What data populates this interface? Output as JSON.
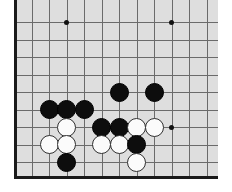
{
  "figure": {
    "kind": "go-board-diagram",
    "width": 232,
    "height": 192
  },
  "board": {
    "background_color": "#dedede",
    "line_color": "#6b6b6b",
    "edge_color": "#1a1a1a",
    "origin_x": 15,
    "origin_y": 22,
    "spacing": 17.5,
    "columns": 12,
    "rows": 9,
    "vertical_lines": [
      15,
      32.5,
      50,
      67.5,
      85,
      102.5,
      120,
      137.5,
      155,
      172.5,
      190,
      207.5
    ],
    "horizontal_lines": [
      22,
      39.5,
      57,
      74.5,
      92,
      109.5,
      127,
      144.5,
      162
    ],
    "edges_visible": [
      "left",
      "bottom"
    ]
  },
  "star_points": [
    {
      "name": "star-top-left",
      "x": 67.5,
      "y": 22
    },
    {
      "name": "star-top-right",
      "x": 172.5,
      "y": 22
    },
    {
      "name": "star-right",
      "x": 172.5,
      "y": 127
    }
  ],
  "stones": [
    {
      "color": "black",
      "x": 120,
      "y": 92
    },
    {
      "color": "black",
      "x": 155,
      "y": 92
    },
    {
      "color": "black",
      "x": 50,
      "y": 109.5
    },
    {
      "color": "black",
      "x": 67.5,
      "y": 109.5
    },
    {
      "color": "black",
      "x": 85,
      "y": 109.5
    },
    {
      "color": "white",
      "x": 67.5,
      "y": 127
    },
    {
      "color": "black",
      "x": 102.5,
      "y": 127
    },
    {
      "color": "black",
      "x": 120,
      "y": 127
    },
    {
      "color": "white",
      "x": 137.5,
      "y": 127
    },
    {
      "color": "white",
      "x": 155,
      "y": 127
    },
    {
      "color": "white",
      "x": 50,
      "y": 144.5
    },
    {
      "color": "white",
      "x": 67.5,
      "y": 144.5
    },
    {
      "color": "white",
      "x": 102.5,
      "y": 144.5
    },
    {
      "color": "white",
      "x": 120,
      "y": 144.5
    },
    {
      "color": "black",
      "x": 137.5,
      "y": 144.5
    },
    {
      "color": "black",
      "x": 67.5,
      "y": 162
    },
    {
      "color": "white",
      "x": 137.5,
      "y": 162
    }
  ],
  "counts": {
    "black_stones": 9,
    "white_stones": 8,
    "total_stones": 17
  }
}
